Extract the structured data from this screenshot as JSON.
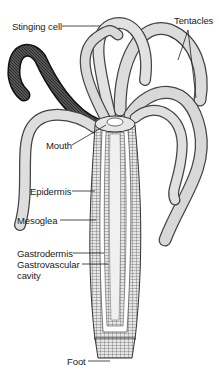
{
  "diagram": {
    "labels": {
      "stinging_cell": "Stinging cell",
      "tentacles": "Tentacles",
      "mouth": "Mouth",
      "epidermis": "Epidermis",
      "mesoglea": "Mesoglea",
      "gastrodermis": "Gastrodermis",
      "gastrovascular_cavity_line1": "Gastrovascular",
      "gastrovascular_cavity_line2": "cavity",
      "foot": "Foot"
    },
    "colors": {
      "ink": "#222222",
      "tentacle_fill": "#d9d9d9",
      "body_fill": "#e8e8e8",
      "cavity_fill": "#f3f3f3",
      "background": "#ffffff"
    }
  }
}
